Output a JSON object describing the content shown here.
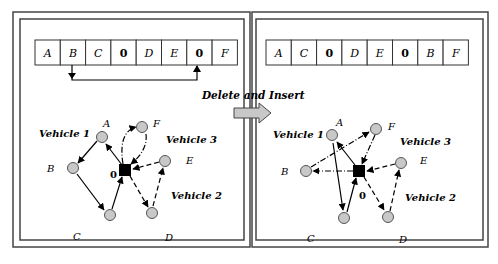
{
  "operation_label": "Delete and Insert",
  "left_panel": {
    "sequence": [
      "A",
      "B",
      "C",
      "0",
      "D",
      "E",
      "0",
      "F"
    ],
    "vehicles": [
      "Vehicle 1",
      "Vehicle 2",
      "Vehicle 3"
    ],
    "depot_label": "0",
    "node_labels": {
      "A": "A",
      "B": "B",
      "C": "C",
      "D": "D",
      "E": "E",
      "F": "F"
    }
  },
  "right_panel": {
    "sequence": [
      "A",
      "C",
      "0",
      "D",
      "E",
      "0",
      "B",
      "F"
    ],
    "vehicles": [
      "Vehicle 1",
      "Vehicle 2",
      "Vehicle 3"
    ],
    "depot_label": "0",
    "node_labels": {
      "A": "A",
      "B": "B",
      "C": "C",
      "D": "D",
      "E": "E",
      "F": "F"
    }
  },
  "colors": {
    "node_fill": "#c8c8c8",
    "depot_fill": "#000000",
    "arrow_fill": "#c8c8c8",
    "border": "#444444"
  }
}
